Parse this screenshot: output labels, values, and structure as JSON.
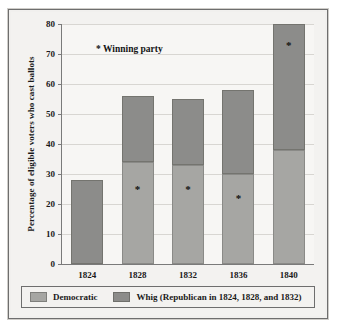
{
  "chart_data": {
    "type": "bar",
    "stacked": true,
    "title": "",
    "xlabel": "",
    "ylabel": "Percentage of eligible voters who cast ballots",
    "ylim": [
      0,
      80
    ],
    "yticks": [
      0,
      10,
      20,
      30,
      40,
      50,
      60,
      70,
      80
    ],
    "ytick_labels": [
      "0",
      "10",
      "20",
      "30",
      "40",
      "50",
      "60",
      "70",
      "80"
    ],
    "categories": [
      "1824",
      "1828",
      "1832",
      "1836",
      "1840"
    ],
    "grid": true,
    "legend_position": "bottom",
    "annotation": "* Winning party",
    "series": [
      {
        "name": "Democratic",
        "color": "#a6a6a3",
        "values": [
          0,
          34,
          33,
          30,
          38
        ]
      },
      {
        "name": "Whig (Republican in 1824, 1828, and 1832)",
        "color": "#8c8c8a",
        "values": [
          28,
          22,
          22,
          28,
          42
        ]
      }
    ],
    "totals": [
      28,
      56,
      55,
      58,
      80
    ],
    "winner_markers": [
      {
        "category": "1824",
        "series": null,
        "value": null,
        "symbol": ""
      },
      {
        "category": "1828",
        "series": "Democratic",
        "value": 25,
        "symbol": "*"
      },
      {
        "category": "1832",
        "series": "Democratic",
        "value": 25,
        "symbol": "*"
      },
      {
        "category": "1836",
        "series": "Democratic",
        "value": 22,
        "symbol": "*"
      },
      {
        "category": "1840",
        "series": "Whig",
        "value": 73,
        "symbol": "*"
      }
    ]
  },
  "legend": {
    "entries": [
      {
        "label": "Democratic",
        "swatch": "dem"
      },
      {
        "label": "Whig (Republican in 1824, 1828, and 1832)",
        "swatch": "whig"
      }
    ]
  },
  "annotation": {
    "winning_party_note": "* Winning party"
  },
  "axis": {
    "y_title": "Percentage of eligible voters who cast ballots"
  }
}
